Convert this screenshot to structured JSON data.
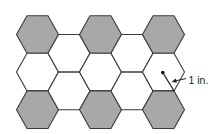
{
  "diagram": {
    "title": "",
    "type": "honeycomb-tiling",
    "hexagon": {
      "orientation": "flat-top",
      "radius_px": 21,
      "half_height_px": 18.8
    },
    "colors": {
      "shaded": "#a8a8a8",
      "unshaded": "#ffffff",
      "stroke": "#3a3a3a",
      "background": "#ffffff"
    },
    "hexagons": [
      {
        "id": "A1",
        "cx": 37.5,
        "cy": 34.5,
        "shaded": true
      },
      {
        "id": "A2",
        "cx": 37.5,
        "cy": 72.1,
        "shaded": false
      },
      {
        "id": "A3",
        "cx": 37.5,
        "cy": 109.7,
        "shaded": true
      },
      {
        "id": "B1",
        "cx": 69,
        "cy": 53.3,
        "shaded": false
      },
      {
        "id": "B2",
        "cx": 69,
        "cy": 90.9,
        "shaded": false
      },
      {
        "id": "C1",
        "cx": 100.5,
        "cy": 34.5,
        "shaded": true
      },
      {
        "id": "C2",
        "cx": 100.5,
        "cy": 72.1,
        "shaded": false
      },
      {
        "id": "C3",
        "cx": 100.5,
        "cy": 109.7,
        "shaded": true
      },
      {
        "id": "D1",
        "cx": 132,
        "cy": 53.3,
        "shaded": false
      },
      {
        "id": "D2",
        "cx": 132,
        "cy": 90.9,
        "shaded": false
      },
      {
        "id": "E1",
        "cx": 163.5,
        "cy": 34.5,
        "shaded": true
      },
      {
        "id": "E2",
        "cx": 163.5,
        "cy": 72.1,
        "shaded": false
      },
      {
        "id": "E3",
        "cx": 163.5,
        "cy": 109.7,
        "shaded": true
      }
    ],
    "annotation": {
      "label": "1 in.",
      "center_dot": {
        "x": 162.8,
        "y": 72.6
      },
      "radius_line_end": {
        "x": 174,
        "y": 90.9
      },
      "arrow_tail": {
        "x": 186,
        "y": 78.5
      },
      "arrow_head": {
        "x": 171.5,
        "y": 81.8
      },
      "label_pos": {
        "x": 188.5,
        "y": 83.5
      }
    }
  }
}
